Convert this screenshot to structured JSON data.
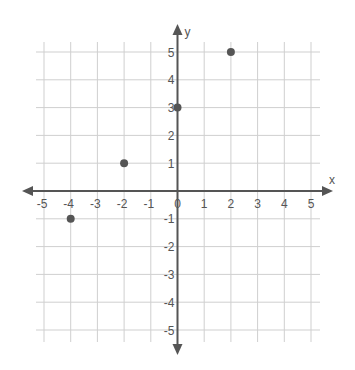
{
  "chart_data": {
    "type": "scatter",
    "title": "",
    "xlabel": "x",
    "ylabel": "y",
    "xlim": [
      -5,
      5
    ],
    "ylim": [
      -5,
      5
    ],
    "grid": true,
    "x_ticks": [
      -5,
      -4,
      -3,
      -2,
      -1,
      0,
      1,
      2,
      3,
      4,
      5
    ],
    "y_ticks": [
      -5,
      -4,
      -3,
      -2,
      -1,
      1,
      2,
      3,
      4,
      5
    ],
    "series": [
      {
        "name": "points",
        "points": [
          {
            "x": -4,
            "y": -1
          },
          {
            "x": -2,
            "y": 1
          },
          {
            "x": 0,
            "y": 3
          },
          {
            "x": 2,
            "y": 5
          }
        ]
      }
    ],
    "legend": null
  },
  "style": {
    "axis_color": "#555555",
    "grid_color": "#cfcfcf",
    "point_color": "#555555",
    "label_color": "#555555"
  },
  "layout": {
    "origin_px": [
      177.5,
      191
    ],
    "unit_px_x": 26.7,
    "unit_px_y": 27.8
  }
}
